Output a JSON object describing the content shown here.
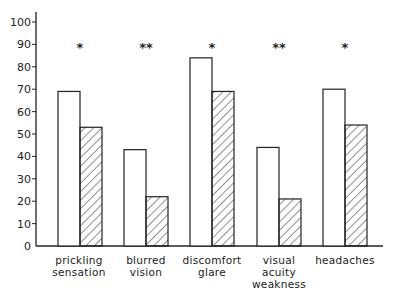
{
  "chart_data": {
    "type": "bar",
    "title": "",
    "xlabel": "",
    "ylabel": "",
    "ylim": [
      0,
      100
    ],
    "yticks": [
      0,
      10,
      20,
      30,
      40,
      50,
      60,
      70,
      80,
      90,
      100
    ],
    "grid": false,
    "legend": null,
    "categories": [
      "prickling sensation",
      "blurred vision",
      "discomfort glare",
      "visual acuity weakness",
      "headaches"
    ],
    "category_lines": [
      [
        "prickling",
        "sensation"
      ],
      [
        "blurred",
        "vision"
      ],
      [
        "discomfort",
        "glare"
      ],
      [
        "visual",
        "acuity",
        "weakness"
      ],
      [
        "headaches"
      ]
    ],
    "series": [
      {
        "name": "open",
        "pattern": "none",
        "values": [
          69,
          43,
          84,
          44,
          70
        ]
      },
      {
        "name": "hatched",
        "pattern": "diagonal-hatch",
        "values": [
          53,
          22,
          69,
          21,
          54
        ]
      }
    ],
    "annotations": [
      "*",
      "**",
      "*",
      "**",
      "*"
    ]
  },
  "colors": {
    "line": "#222222",
    "background": "#ffffff"
  }
}
